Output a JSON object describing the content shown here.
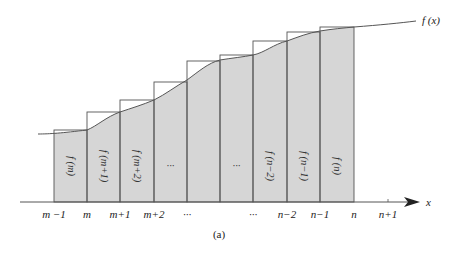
{
  "figure": {
    "caption": "(a)",
    "curve_label": "f (x)",
    "axis_label": "x",
    "colors": {
      "fill": "#d6d6d6",
      "stroke": "#555555",
      "curve": "#555555",
      "text": "#222222"
    }
  },
  "x_ticks": [
    {
      "label": "m −1",
      "x": 54
    },
    {
      "label": "m",
      "x": 87
    },
    {
      "label": "m+1",
      "x": 120
    },
    {
      "label": "m+2",
      "x": 154
    },
    {
      "label": "···",
      "x": 187
    },
    {
      "label": "···",
      "x": 253
    },
    {
      "label": "n−2",
      "x": 287
    },
    {
      "label": "n−1",
      "x": 320
    },
    {
      "label": "n",
      "x": 354
    },
    {
      "label": "n+1",
      "x": 388
    }
  ],
  "bars": [
    {
      "x0": 54,
      "x1": 87,
      "top": 130,
      "label": "f (m)"
    },
    {
      "x0": 87,
      "x1": 120,
      "top": 112,
      "label": "f (m+1)"
    },
    {
      "x0": 120,
      "x1": 154,
      "top": 100,
      "label": "f (m+2)"
    },
    {
      "x0": 154,
      "x1": 187,
      "top": 82,
      "label": "···"
    },
    {
      "x0": 187,
      "x1": 220,
      "top": 61,
      "label": ""
    },
    {
      "x0": 220,
      "x1": 253,
      "top": 55,
      "label": "···"
    },
    {
      "x0": 253,
      "x1": 287,
      "top": 41,
      "label": "f (n−2)"
    },
    {
      "x0": 287,
      "x1": 320,
      "top": 32,
      "label": "f (n−1)"
    },
    {
      "x0": 320,
      "x1": 354,
      "top": 27,
      "label": "f (n)"
    }
  ],
  "chart_data": {
    "type": "area",
    "title": "",
    "caption": "(a)",
    "xlabel": "x",
    "ylabel": "",
    "curve_label": "f(x)",
    "categories": [
      "m−1",
      "m",
      "m+1",
      "m+2",
      "…",
      "…",
      "n−2",
      "n−1",
      "n",
      "n+1"
    ],
    "series": [
      {
        "name": "rectangle heights (upper sum, value at right endpoint)",
        "labels": [
          "f(m)",
          "f(m+1)",
          "f(m+2)",
          "…",
          "",
          "…",
          "f(n−2)",
          "f(n−1)",
          "f(n)"
        ]
      }
    ],
    "grid": false,
    "legend": "none"
  }
}
